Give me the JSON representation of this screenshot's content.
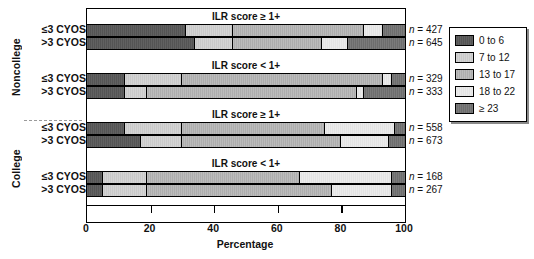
{
  "chart_data": {
    "type": "bar",
    "orientation": "horizontal",
    "stacked": true,
    "normalized_percent": true,
    "title": "",
    "xlabel": "Percentage",
    "ylabel": "",
    "xlim": [
      0,
      100
    ],
    "xticks": [
      0,
      20,
      40,
      60,
      80,
      100
    ],
    "grid": false,
    "legend_position": "right",
    "series": [
      {
        "name": "0 to 6",
        "color": "#595959",
        "values": [
          31,
          34,
          12,
          12,
          12,
          17,
          5,
          5
        ]
      },
      {
        "name": "7 to 12",
        "color": "#cfcfcf",
        "values": [
          15,
          12,
          18,
          7,
          18,
          13,
          14,
          14
        ]
      },
      {
        "name": "13 to 17",
        "color": "#b4b4b4",
        "values": [
          41,
          28,
          63,
          66,
          45,
          50,
          48,
          58
        ]
      },
      {
        "name": "18 to 22",
        "color": "#e8e8e8",
        "values": [
          6,
          8,
          3,
          2,
          22,
          15,
          29,
          19
        ]
      },
      {
        "name": "≥ 23",
        "color": "#737373",
        "values": [
          7,
          18,
          4,
          13,
          3,
          5,
          4,
          4
        ]
      }
    ],
    "categories": [
      "Noncollege / ILR score ≥ 1+ / ≤3 CYOS",
      "Noncollege / ILR score ≥ 1+ / >3 CYOS",
      "Noncollege / ILR score < 1+ / ≤3 CYOS",
      "Noncollege / ILR score < 1+ / >3 CYOS",
      "College / ILR score ≥ 1+ / ≤3 CYOS",
      "College / ILR score ≥ 1+ / >3 CYOS",
      "College / ILR score < 1+ / ≤3 CYOS",
      "College / ILR score < 1+ / >3 CYOS"
    ],
    "group_counts": [
      427,
      645,
      329,
      333,
      558,
      673,
      168,
      267
    ]
  },
  "supergroups": [
    {
      "label": "Noncollege"
    },
    {
      "label": "College"
    }
  ],
  "panels": [
    {
      "title": "ILR score ≥ 1+",
      "rows": [
        {
          "label": "≤3 CYOS",
          "n_text": "n = 427",
          "values": [
            31,
            15,
            41,
            6,
            7
          ]
        },
        {
          "label": ">3 CYOS",
          "n_text": "n = 645",
          "values": [
            34,
            12,
            28,
            8,
            18
          ]
        }
      ]
    },
    {
      "title": "ILR score < 1+",
      "rows": [
        {
          "label": "≤3 CYOS",
          "n_text": "n = 329",
          "values": [
            12,
            18,
            63,
            3,
            4
          ]
        },
        {
          "label": ">3 CYOS",
          "n_text": "n = 333",
          "values": [
            12,
            7,
            66,
            2,
            13
          ]
        }
      ]
    },
    {
      "title": "ILR score ≥ 1+",
      "rows": [
        {
          "label": "≤3 CYOS",
          "n_text": "n = 558",
          "values": [
            12,
            18,
            45,
            22,
            3
          ]
        },
        {
          "label": ">3 CYOS",
          "n_text": "n = 673",
          "values": [
            17,
            13,
            50,
            15,
            5
          ]
        }
      ]
    },
    {
      "title": "ILR score < 1+",
      "rows": [
        {
          "label": "≤3 CYOS",
          "n_text": "n = 168",
          "values": [
            5,
            14,
            48,
            29,
            4
          ]
        },
        {
          "label": ">3 CYOS",
          "n_text": "n = 267",
          "values": [
            5,
            14,
            58,
            19,
            4
          ]
        }
      ]
    }
  ],
  "axis": {
    "title": "Percentage",
    "ticks": [
      "0",
      "20",
      "40",
      "60",
      "80",
      "100"
    ]
  },
  "legend": {
    "items": [
      {
        "label": "0 to 6",
        "color": "#595959"
      },
      {
        "label": "7 to 12",
        "color": "#cfcfcf"
      },
      {
        "label": "13 to 17",
        "color": "#b4b4b4"
      },
      {
        "label": "18 to 22",
        "color": "#e8e8e8"
      },
      {
        "label": "≥ 23",
        "color": "#737373"
      }
    ]
  }
}
